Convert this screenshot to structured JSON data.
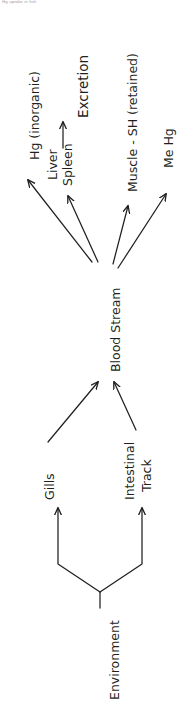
{
  "document": {
    "header_note": "Hg uptake in fish",
    "orientation": "rotated-90-ccw",
    "background_color": "#ffffff",
    "ink_color": "#231f20"
  },
  "diagram": {
    "type": "flowchart",
    "nodes": [
      {
        "id": "environment",
        "label": "Environment",
        "font_size": 12.5
      },
      {
        "id": "gills",
        "label": "Gills",
        "font_size": 12.5
      },
      {
        "id": "intestinal-track",
        "label": "Intestinal",
        "font_size": 12.5
      },
      {
        "id": "intestinal-track2",
        "label": "Track",
        "font_size": 12.5
      },
      {
        "id": "blood-stream",
        "label": "Blood  Stream",
        "font_size": 12.5
      },
      {
        "id": "hg-inorganic",
        "label": "Hg (inorganic)",
        "font_size": 12.5
      },
      {
        "id": "liver",
        "label": "Liver",
        "font_size": 12.5
      },
      {
        "id": "spleen",
        "label": "Spleen",
        "font_size": 12.5
      },
      {
        "id": "excretion",
        "label": "Excretion",
        "font_size": 13.5
      },
      {
        "id": "muscle-sh",
        "label": "Muscle - SH (retained)",
        "font_size": 12.5
      },
      {
        "id": "me-hg",
        "label": "Me Hg",
        "font_size": 12.5
      }
    ],
    "edges": [
      {
        "id": "env-to-gills",
        "from": "Environment",
        "to": "Gills"
      },
      {
        "id": "env-to-intestinal",
        "from": "Environment",
        "to": "Intestinal Track"
      },
      {
        "id": "gills-to-blood",
        "from": "Gills",
        "to": "Blood Stream"
      },
      {
        "id": "intestinal-to-blood",
        "from": "Intestinal Track",
        "to": "Blood Stream"
      },
      {
        "id": "blood-to-hg",
        "from": "Blood Stream",
        "to": "Hg (inorganic)"
      },
      {
        "id": "blood-to-liver",
        "from": "Blood Stream",
        "to": "Liver Spleen"
      },
      {
        "id": "liver-to-excretion",
        "from": "Liver Spleen",
        "to": "Excretion"
      },
      {
        "id": "blood-to-muscle",
        "from": "Blood Stream",
        "to": "Muscle - SH (retained)"
      },
      {
        "id": "blood-to-mehg",
        "from": "Blood Stream",
        "to": "Me Hg"
      }
    ]
  }
}
